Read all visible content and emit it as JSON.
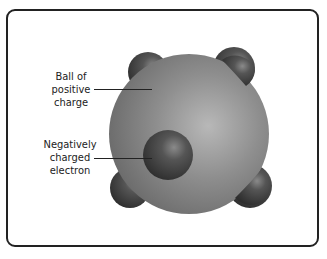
{
  "diagram": {
    "labels": {
      "positive": [
        "Ball of",
        "positive",
        "charge"
      ],
      "electron": [
        "Negatively",
        "charged",
        "electron"
      ]
    },
    "colors": {
      "sphere": "#8c8c8c",
      "electron": "#4a4a4a",
      "border": "#222222"
    }
  }
}
